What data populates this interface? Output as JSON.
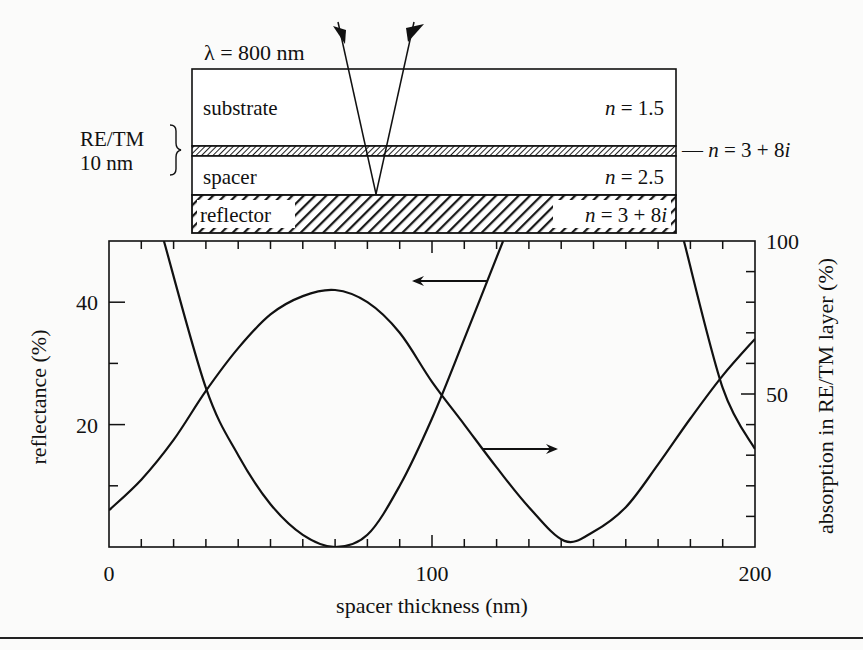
{
  "diagram": {
    "wavelength_label": "λ = 800 nm",
    "layers": [
      {
        "name": "substrate",
        "label": "substrate",
        "index": "n = 1.5"
      },
      {
        "name": "retm",
        "label": "RE/TM",
        "thickness": "10 nm",
        "index": "n = 3 + 8i"
      },
      {
        "name": "spacer",
        "label": "spacer",
        "index": "n = 2.5"
      },
      {
        "name": "reflector",
        "label": "reflector",
        "index": "n = 3 + 8i"
      }
    ],
    "retm_label_line1": "RE/TM",
    "retm_label_line2": "10 nm",
    "retm_index_prefix": "— ",
    "n_italic": "n",
    "i_italic": "i"
  },
  "chart_data": {
    "type": "line",
    "title": "",
    "xlabel": "spacer thickness (nm)",
    "ylabel": "reflectance (%)",
    "y2label": "absorption in RE/TM layer (%)",
    "xlim": [
      0,
      200
    ],
    "ylim": [
      0,
      50
    ],
    "y2lim": [
      0,
      100
    ],
    "x_ticks": [
      "0",
      "100",
      "200"
    ],
    "y_ticks": [
      "20",
      "40"
    ],
    "y2_ticks": [
      "50",
      "100"
    ],
    "grid": false,
    "annotations": [
      {
        "type": "arrow",
        "direction": "left",
        "meaning": "reflectance curve uses left axis"
      },
      {
        "type": "arrow",
        "direction": "right",
        "meaning": "absorption curve uses right axis"
      }
    ],
    "series": [
      {
        "name": "reflectance",
        "axis": "left",
        "x": [
          17,
          30,
          40,
          50,
          60,
          70,
          80,
          90,
          100,
          110,
          122,
          130,
          141,
          150,
          160,
          170,
          178,
          190,
          200
        ],
        "values": [
          50,
          26,
          15,
          7,
          2,
          0,
          2,
          10,
          21,
          34,
          50,
          6,
          0,
          3,
          13,
          30,
          50,
          26,
          16
        ]
      },
      {
        "name": "absorption in RE/TM layer",
        "axis": "right",
        "x": [
          0,
          10,
          20,
          30,
          40,
          50,
          60,
          70,
          80,
          90,
          100,
          110,
          120,
          130,
          141,
          150,
          160,
          170,
          180,
          190,
          200
        ],
        "values": [
          12,
          22,
          35,
          51,
          65,
          76,
          82,
          84,
          80,
          70,
          54,
          40,
          26,
          13,
          2,
          5,
          13,
          27,
          42,
          56,
          68
        ]
      }
    ]
  }
}
